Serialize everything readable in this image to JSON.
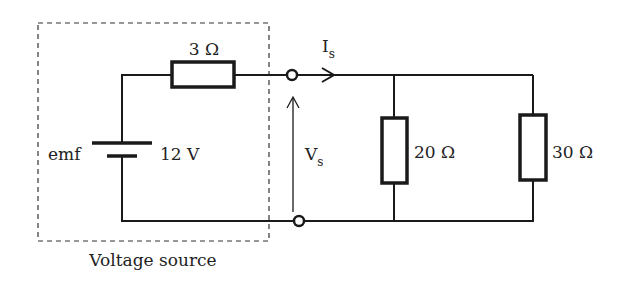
{
  "diagram": {
    "type": "circuit-schematic",
    "colors": {
      "wire": "#1a1a1a",
      "text": "#222222",
      "background": "#ffffff"
    },
    "voltage_source": {
      "label": "Voltage source",
      "emf_label": "emf",
      "emf_value": "12 V",
      "internal_resistance": "3 Ω"
    },
    "output": {
      "current_label": "I",
      "current_subscript": "s",
      "voltage_label": "V",
      "voltage_subscript": "s"
    },
    "loads": [
      {
        "label": "20 Ω"
      },
      {
        "label": "30 Ω"
      }
    ]
  }
}
